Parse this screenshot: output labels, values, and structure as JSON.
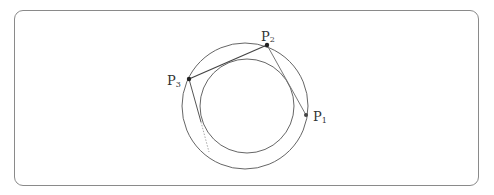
{
  "diagram": {
    "outer_circle": {
      "cx": 245,
      "cy": 106,
      "r": 63
    },
    "inner_circle": {
      "cx": 247,
      "cy": 106,
      "r": 47
    },
    "points": [
      {
        "id": "P1",
        "label": "P",
        "sub": "1",
        "x": 306,
        "y": 115
      },
      {
        "id": "P2",
        "label": "P",
        "sub": "2",
        "x": 267,
        "y": 45
      },
      {
        "id": "P3",
        "label": "P",
        "sub": "3",
        "x": 189,
        "y": 79
      }
    ],
    "colors": {
      "stroke": "#555555",
      "frame": "#8a8a8a",
      "dotted": "#aaaaaa"
    }
  }
}
